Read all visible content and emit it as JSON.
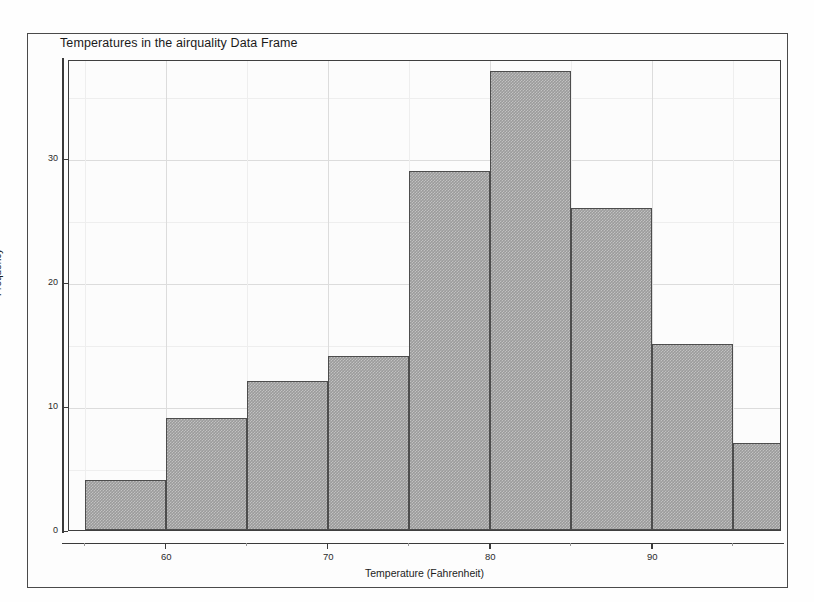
{
  "figure": {
    "title": "Temperatures in the airquality Data Frame",
    "background_color": "#fefefe",
    "frame_color": "#4a4a4a",
    "panel_color": "#fcfcfc",
    "bar_fill_color": "#9b9b9b",
    "bar_border_color": "#4d4d4d",
    "gridline_color": "#e6e6e6"
  },
  "chart_data": {
    "type": "bar",
    "title": "Temperatures in the airquality Data Frame",
    "xlabel": "Temperature (Fahrenheit)",
    "ylabel": "Frequency",
    "xlim": [
      54,
      98
    ],
    "ylim": [
      0,
      38
    ],
    "grid": true,
    "legend": "none",
    "bin_width": 5,
    "bin_edges": [
      55,
      60,
      65,
      70,
      75,
      80,
      85,
      90,
      95,
      100
    ],
    "categories": [
      "55-60",
      "60-65",
      "65-70",
      "70-75",
      "75-80",
      "80-85",
      "85-90",
      "90-95",
      "95-100"
    ],
    "values": [
      4,
      9,
      12,
      14,
      29,
      37,
      26,
      15,
      7
    ],
    "x_ticks": [
      60,
      70,
      80,
      90
    ],
    "x_tick_labels": [
      "60",
      "70",
      "80",
      "90"
    ],
    "y_ticks": [
      0,
      10,
      20,
      30
    ],
    "y_tick_labels": [
      "0",
      "10",
      "20",
      "30"
    ],
    "y_minor_ticks": [
      5,
      15,
      25,
      35
    ],
    "x_minor_ticks": [
      55,
      65,
      75,
      85,
      95
    ]
  }
}
